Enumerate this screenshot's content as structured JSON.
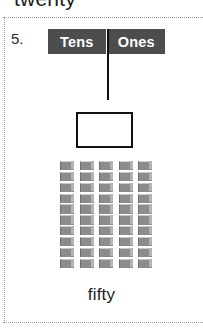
{
  "worksheet": {
    "previous_item_word": "twenty",
    "item_number": "5.",
    "place_value_chart": {
      "tens_label": "Tens",
      "ones_label": "Ones"
    },
    "answer_box": {
      "value": ""
    },
    "caption": "fifty",
    "colors": {
      "header_background": "#4d4d4d",
      "header_text": "#ffffff",
      "block_face": "#8c8c8c",
      "block_highlight": "#b4b4b4",
      "outline": "#111111",
      "dotted_rule": "#9a9a9a"
    }
  },
  "manipulative": {
    "type": "base-ten-rods",
    "rod_count": 5,
    "units_per_rod": 10,
    "total_value": 50,
    "rods": [
      {
        "units": 10
      },
      {
        "units": 10
      },
      {
        "units": 10
      },
      {
        "units": 10
      },
      {
        "units": 10
      }
    ]
  }
}
